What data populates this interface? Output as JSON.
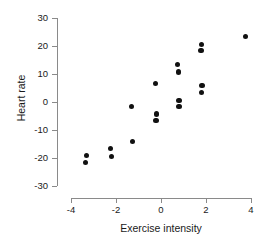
{
  "chart_data": {
    "type": "scatter",
    "title": "",
    "subtitle": "",
    "xlabel": "Exercise intensity",
    "ylabel": "Heart rate",
    "xlim": [
      -4.4,
      4.4
    ],
    "ylim": [
      -31,
      31
    ],
    "xticks": [
      -4,
      -2,
      0,
      2,
      4
    ],
    "xticklabels": [
      "-4",
      "-2",
      "0",
      "2",
      "4"
    ],
    "yticks": [
      -30,
      -20,
      -10,
      0,
      10,
      20,
      30
    ],
    "yticklabels": [
      "-30",
      "-20",
      "-10",
      "0",
      "10",
      "20",
      "30"
    ],
    "grid": false,
    "legend": null,
    "annotations": [],
    "marker": {
      "shape": "circle",
      "color": "#111111",
      "size": 5.2
    },
    "series": [
      {
        "name": "observations",
        "n": 19,
        "points": [
          {
            "x": -3.35,
            "y": -21.5
          },
          {
            "x": -3.3,
            "y": -19.2
          },
          {
            "x": -2.25,
            "y": -16.5
          },
          {
            "x": -2.2,
            "y": -19.6
          },
          {
            "x": -1.3,
            "y": -1.5
          },
          {
            "x": -1.25,
            "y": -14.2
          },
          {
            "x": -0.25,
            "y": 6.5
          },
          {
            "x": -0.2,
            "y": -4.3
          },
          {
            "x": -0.22,
            "y": -6.6
          },
          {
            "x": 0.75,
            "y": 13.5
          },
          {
            "x": 0.78,
            "y": 10.7
          },
          {
            "x": 0.8,
            "y": 0.5
          },
          {
            "x": 0.8,
            "y": -1.5
          },
          {
            "x": 1.8,
            "y": 20.6
          },
          {
            "x": 1.78,
            "y": 18.3
          },
          {
            "x": 1.82,
            "y": 5.8
          },
          {
            "x": 1.8,
            "y": 3.4
          },
          {
            "x": 3.75,
            "y": 23.4
          },
          {
            "x": 2.0,
            "y": 9999
          }
        ]
      }
    ]
  }
}
